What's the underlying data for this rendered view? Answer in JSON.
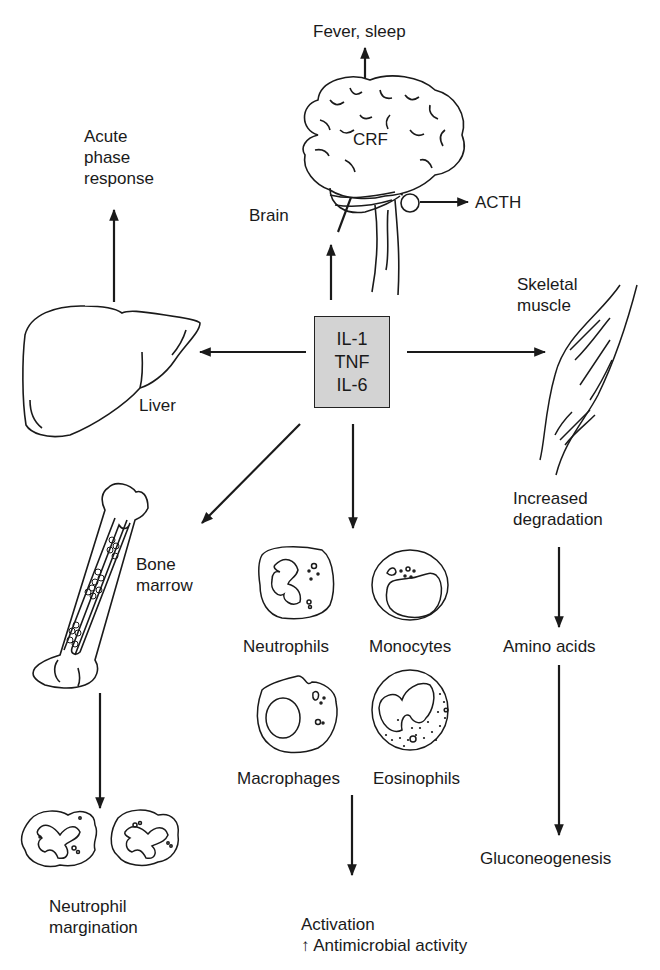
{
  "diagram": {
    "center": {
      "label": "Cytokine box",
      "lines": [
        "IL-1",
        "TNF",
        "IL-6"
      ],
      "fill": "#d3d3d3"
    },
    "brain": {
      "label": "Brain",
      "internal": "CRF",
      "outputs": [
        "Fever, sleep",
        "ACTH"
      ]
    },
    "liver": {
      "label": "Liver",
      "output_lines": [
        "Acute",
        "phase",
        "response"
      ]
    },
    "muscle": {
      "label_lines": [
        "Skeletal",
        "muscle"
      ],
      "effect_lines": [
        "Increased",
        "degradation"
      ],
      "product": "Amino acids",
      "final": "Gluconeogenesis"
    },
    "bone": {
      "label_lines": [
        "Bone",
        "marrow"
      ],
      "effect_lines": [
        "Neutrophil",
        "margination"
      ]
    },
    "cells": {
      "types": [
        "Neutrophils",
        "Monocytes",
        "Macrophages",
        "Eosinophils"
      ],
      "effect_lines": [
        "Activation",
        "↑ Antimicrobial activity"
      ]
    }
  }
}
